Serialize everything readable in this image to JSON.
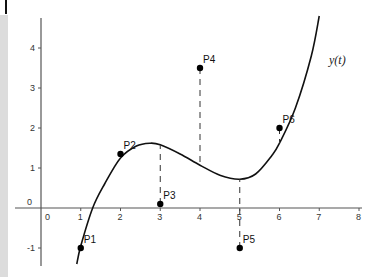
{
  "chart_data": {
    "type": "scatter",
    "title": "",
    "xlabel": "",
    "ylabel": "",
    "xlim": [
      -0.65,
      8.1
    ],
    "ylim": [
      -1.4,
      4.8
    ],
    "grid": false,
    "x_ticks": [
      "0",
      "1",
      "2",
      "3",
      "4",
      "5",
      "6",
      "7",
      "8"
    ],
    "y_ticks": [
      "-1",
      "0",
      "1",
      "2",
      "3",
      "4"
    ],
    "curve": {
      "label": "y(t)",
      "points": [
        [
          0.9,
          -1.4
        ],
        [
          1.0,
          -0.95
        ],
        [
          1.3,
          0.0
        ],
        [
          1.6,
          0.6
        ],
        [
          2.0,
          1.25
        ],
        [
          2.4,
          1.55
        ],
        [
          2.75,
          1.62
        ],
        [
          3.0,
          1.58
        ],
        [
          3.5,
          1.35
        ],
        [
          4.0,
          1.07
        ],
        [
          4.5,
          0.82
        ],
        [
          5.0,
          0.72
        ],
        [
          5.4,
          0.85
        ],
        [
          5.8,
          1.3
        ],
        [
          6.0,
          1.62
        ],
        [
          6.4,
          2.5
        ],
        [
          6.8,
          3.8
        ],
        [
          7.0,
          4.8
        ]
      ]
    },
    "series": [
      {
        "name": "P1",
        "x": 1,
        "y": -1
      },
      {
        "name": "P2",
        "x": 2,
        "y": 1.35
      },
      {
        "name": "P3",
        "x": 3,
        "y": 0.1
      },
      {
        "name": "P4",
        "x": 4,
        "y": 3.5
      },
      {
        "name": "P5",
        "x": 5,
        "y": -1
      },
      {
        "name": "P6",
        "x": 6,
        "y": 2
      }
    ],
    "residual_lines": "dashed vertical lines connect each point to the curve",
    "legend": "none"
  },
  "labels": {
    "origin_x": "0",
    "origin_y": "0",
    "function": "y(t)"
  }
}
